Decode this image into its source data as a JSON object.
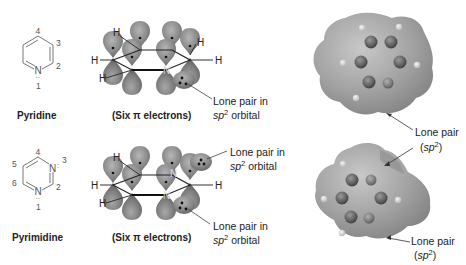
{
  "figure": {
    "rows": [
      {
        "molecule": "Pyridine",
        "ring_labels": {
          "n1": "N",
          "pos1": "1",
          "pos2": "2",
          "pos3": "3",
          "pos4": "4"
        },
        "orbital_caption": "(Six π electrons)",
        "orbital_callout": {
          "line1": "Lone pair in",
          "line2_italic": "sp",
          "line2_sup": "2",
          "line2_rest": " orbital"
        },
        "epm_callout": {
          "line1": "Lone pair",
          "line2_open": "(",
          "line2_italic": "sp",
          "line2_sup": "2",
          "line2_close": ")"
        }
      },
      {
        "molecule": "Pyrimidine",
        "ring_labels": {
          "n1": "N",
          "n3": "N",
          "pos1": "1",
          "pos2": "2",
          "pos3": "3",
          "pos4": "4",
          "pos5": "5",
          "pos6": "6"
        },
        "orbital_caption": "(Six π electrons)",
        "orbital_callout_top": {
          "line1": "Lone pair in",
          "line2_italic": "sp",
          "line2_sup": "2",
          "line2_rest": " orbital"
        },
        "orbital_callout_bottom": {
          "line1": "Lone pair in",
          "line2_italic": "sp",
          "line2_sup": "2",
          "line2_rest": " orbital"
        },
        "epm_callout": {
          "line1": "Lone pair",
          "line2_open": "(",
          "line2_italic": "sp",
          "line2_sup": "2",
          "line2_close": ")"
        }
      }
    ],
    "hydrogen_label": "H",
    "nitrogen_label": "N",
    "colors": {
      "bond": "#777777",
      "lobe": "#8a8a8a",
      "lobe_dark": "#5e5e5e",
      "surface": "#9a9a9a",
      "atom": "#6a6a6a"
    }
  }
}
